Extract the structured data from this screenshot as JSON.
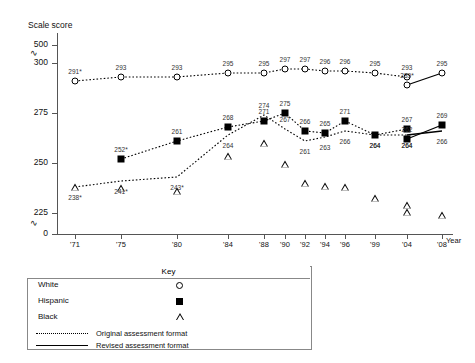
{
  "chart_data": {
    "type": "line",
    "title": "",
    "ylabel": "Scale score",
    "xlabel": "Year",
    "grid": false,
    "legend_position": "bottom-left",
    "ylim": [
      225,
      300
    ],
    "y_ticks": [
      "500",
      "300",
      "275",
      "250",
      "225",
      "0"
    ],
    "y_axis_breaks": [
      "between 500 and 300",
      "between 225 and 0"
    ],
    "x": [
      "'71",
      "'75",
      "'80",
      "'84",
      "'88",
      "'90",
      "'92",
      "'94",
      "'96",
      "'99",
      "'04",
      "'08"
    ],
    "series": [
      {
        "name": "White",
        "marker": "circle-open",
        "format": "original",
        "values": [
          291,
          293,
          293,
          295,
          295,
          297,
          297,
          296,
          296,
          295,
          293,
          null
        ],
        "labels": [
          "291*",
          "293",
          "293",
          "295",
          "295",
          "297",
          "297",
          "296",
          "296",
          "295",
          "293",
          ""
        ]
      },
      {
        "name": "White",
        "marker": "circle-open",
        "format": "revised",
        "values": [
          null,
          null,
          null,
          null,
          null,
          null,
          null,
          null,
          null,
          null,
          289,
          295
        ],
        "labels": [
          "",
          "",
          "",
          "",
          "",
          "",
          "",
          "",
          "",
          "",
          "289*",
          "295"
        ]
      },
      {
        "name": "Hispanic",
        "marker": "square-filled",
        "format": "original",
        "values": [
          null,
          252,
          261,
          268,
          271,
          275,
          266,
          265,
          271,
          264,
          267,
          null
        ],
        "labels": [
          "",
          "252*",
          "261",
          "268",
          "271",
          "275",
          "266",
          "265",
          "271",
          "264",
          "267",
          ""
        ]
      },
      {
        "name": "Hispanic",
        "marker": "square-filled",
        "format": "revised",
        "values": [
          null,
          null,
          null,
          null,
          null,
          null,
          null,
          null,
          null,
          null,
          262,
          269
        ],
        "labels": [
          "",
          "",
          "",
          "",
          "",
          "",
          "",
          "",
          "",
          "",
          "262",
          "269"
        ]
      },
      {
        "name": "Black",
        "marker": "triangle-open",
        "format": "original",
        "values": [
          238,
          241,
          243,
          264,
          274,
          267,
          261,
          263,
          266,
          264,
          264,
          null
        ],
        "labels": [
          "238*",
          "241*",
          "243*",
          "264",
          "274",
          "267",
          "261",
          "263",
          "266",
          "264",
          "264",
          ""
        ]
      },
      {
        "name": "Black",
        "marker": "triangle-open",
        "format": "revised",
        "values": [
          null,
          null,
          null,
          null,
          null,
          null,
          null,
          null,
          null,
          null,
          264,
          266
        ],
        "labels": [
          "",
          "",
          "",
          "",
          "",
          "",
          "",
          "",
          "",
          "",
          "264",
          "266"
        ]
      }
    ]
  },
  "key": {
    "title": "Key",
    "entries": [
      {
        "label": "White",
        "symbol": "circle-open"
      },
      {
        "label": "Hispanic",
        "symbol": "square-filled"
      },
      {
        "label": "Black",
        "symbol": "triangle-open"
      }
    ],
    "formats": [
      {
        "label": "Original assessment format",
        "line": "dotted"
      },
      {
        "label": "Revised assessment format",
        "line": "solid"
      }
    ]
  },
  "axes": {
    "y_title": "Scale score",
    "x_title": "Year",
    "y_ticks": [
      {
        "value": "500"
      },
      {
        "value": "300"
      },
      {
        "value": "275"
      },
      {
        "value": "250"
      },
      {
        "value": "225"
      },
      {
        "value": "0"
      }
    ],
    "x_ticks": [
      {
        "label": "'71"
      },
      {
        "label": "'75"
      },
      {
        "label": "'80"
      },
      {
        "label": "'84"
      },
      {
        "label": "'88"
      },
      {
        "label": "'90"
      },
      {
        "label": "'92"
      },
      {
        "label": "'94"
      },
      {
        "label": "'96"
      },
      {
        "label": "'99"
      },
      {
        "label": "'04"
      },
      {
        "label": "'08"
      }
    ],
    "break_glyph": "∿"
  },
  "colors": {
    "axis": "#555555",
    "text": "#111111",
    "marker": "#000000",
    "label": "#333333"
  }
}
